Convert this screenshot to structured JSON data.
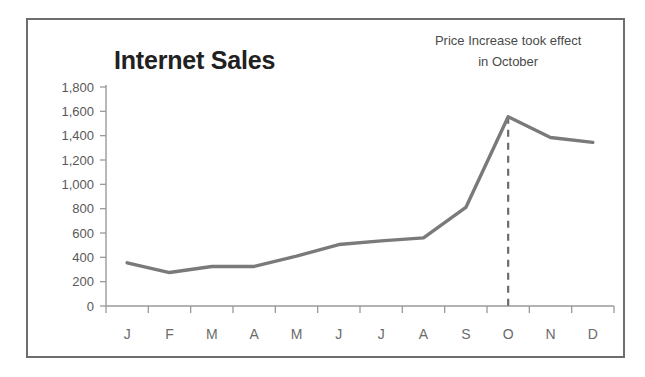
{
  "chart_data": {
    "type": "line",
    "title": "Internet Sales",
    "xlabel": "",
    "ylabel": "",
    "categories": [
      "J",
      "F",
      "M",
      "A",
      "M",
      "J",
      "J",
      "A",
      "S",
      "O",
      "N",
      "D"
    ],
    "category_names": [
      "January",
      "February",
      "March",
      "April",
      "May",
      "June",
      "July",
      "August",
      "September",
      "October",
      "November",
      "December"
    ],
    "values": [
      355,
      275,
      325,
      325,
      410,
      505,
      535,
      560,
      810,
      1555,
      1385,
      1345
    ],
    "series": [
      {
        "name": "Internet Sales",
        "values": [
          355,
          275,
          325,
          325,
          410,
          505,
          535,
          560,
          810,
          1555,
          1385,
          1345
        ],
        "color": "#7a7a7a"
      }
    ],
    "ylim": [
      0,
      1800
    ],
    "ytick_values": [
      0,
      200,
      400,
      600,
      800,
      1000,
      1200,
      1400,
      1600,
      1800
    ],
    "ytick_labels": [
      "0",
      "200",
      "400",
      "600",
      "800",
      "1,000",
      "1,200",
      "1,400",
      "1,600",
      "1,800"
    ],
    "grid": false,
    "legend": "none",
    "annotations": [
      {
        "id": "price-increase-note",
        "lines": [
          "Price Increase took effect",
          "in October"
        ],
        "anchor_category": "O",
        "marker": "vertical-dashed-line"
      }
    ]
  },
  "styles": {
    "line_color": "#7a7a7a",
    "axis_color": "#9a9a9a",
    "border_color": "#6e6e6e",
    "title_color": "#212121",
    "tick_label_color": "#595959",
    "annotation_color": "#4a4a4a",
    "background": "#ffffff"
  }
}
